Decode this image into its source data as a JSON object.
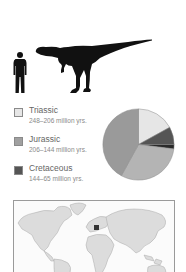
{
  "figure": {
    "scale_comparison": {
      "human_icon": "human-silhouette",
      "dinosaur_icon": "theropod-dinosaur-silhouette"
    },
    "legend": {
      "items": [
        {
          "name": "Triassic",
          "range": "248–206 million yrs.",
          "color": "#e6e6e6"
        },
        {
          "name": "Jurassic",
          "range": "206–144 million yrs.",
          "color": "#a0a0a0"
        },
        {
          "name": "Cretaceous",
          "range": "144–65 million yrs.",
          "color": "#555555"
        }
      ]
    },
    "map": {
      "icon": "world-map",
      "highlight_region": "Europe (Germany)",
      "land_color": "#d9d9d9",
      "highlight_color": "#333333"
    }
  },
  "chart_data": {
    "type": "pie",
    "title": "",
    "slices": [
      {
        "label": "Triassic",
        "value": 17,
        "color": "#e6e6e6"
      },
      {
        "label": "Cretaceous",
        "value": 8,
        "color": "#555555"
      },
      {
        "label": "Cretaceous (dark band)",
        "value": 2,
        "color": "#2a2a2a"
      },
      {
        "label": "Jurassic (light)",
        "value": 31,
        "color": "#b4b4b4"
      },
      {
        "label": "Jurassic",
        "value": 42,
        "color": "#9a9a9a"
      }
    ],
    "start_angle_deg": 0,
    "direction": "clockwise",
    "legend_position": "left"
  }
}
